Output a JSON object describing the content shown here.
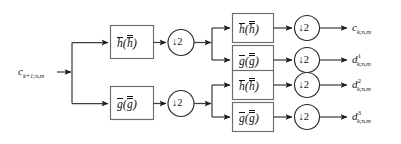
{
  "diagram": {
    "type": "signal-flow-block-diagram",
    "background_color": "#ffffff",
    "line_color": "#3f3f42",
    "box_stroke_color": "#6b6b70",
    "text_color": "#141416"
  },
  "input": {
    "name": "input-signal",
    "base": "c",
    "subscript": "k+1;n,m",
    "superscript": "",
    "label": "c_{k+1;n,m}"
  },
  "stage1": {
    "name": "first-decomposition-stage",
    "branches": [
      {
        "id": "s1-lowpass",
        "filter_base": "h",
        "filter_overline": "single",
        "filter_inner_base": "h",
        "filter_inner_overline": "double",
        "filter_label": "h̄(h̅̅)",
        "downsampler": "↓2",
        "downsample_factor": "2"
      },
      {
        "id": "s1-highpass",
        "filter_base": "g",
        "filter_overline": "single",
        "filter_inner_base": "g",
        "filter_inner_overline": "double",
        "filter_label": "ḡ(g̅̅)",
        "downsampler": "↓2",
        "downsample_factor": "2"
      }
    ]
  },
  "stage2": {
    "name": "second-decomposition-stage",
    "branches": [
      {
        "id": "s2-row0-lowpass",
        "filter_base": "h",
        "filter_label": "h̄(h̅̅)",
        "downsampler": "↓2",
        "downsample_factor": "2",
        "output": {
          "base": "c",
          "subscript": "k;n,m",
          "superscript": "",
          "label": "c_{k;n,m}"
        }
      },
      {
        "id": "s2-row1-highpass",
        "filter_base": "g",
        "filter_label": "ḡ(g̅̅)",
        "downsampler": "↓2",
        "downsample_factor": "2",
        "output": {
          "base": "d",
          "subscript": "k;n,m",
          "superscript": "1",
          "label": "d^1_{k;n,m}"
        }
      },
      {
        "id": "s2-row2-lowpass",
        "filter_base": "h",
        "filter_label": "h̄(h̅̅)",
        "downsampler": "↓2",
        "downsample_factor": "2",
        "output": {
          "base": "d",
          "subscript": "k;n,m",
          "superscript": "2",
          "label": "d^2_{k;n,m}"
        }
      },
      {
        "id": "s2-row3-highpass",
        "filter_base": "g",
        "filter_label": "ḡ(g̅̅)",
        "downsampler": "↓2",
        "downsample_factor": "2",
        "output": {
          "base": "d",
          "subscript": "k;n,m",
          "superscript": "3",
          "label": "d^3_{k;n,m}"
        }
      }
    ]
  },
  "glyphs": {
    "down_arrow": "↓",
    "two": "2",
    "paren_open": "(",
    "paren_close": ")",
    "h": "h",
    "g": "g",
    "c": "c",
    "d": "d"
  }
}
